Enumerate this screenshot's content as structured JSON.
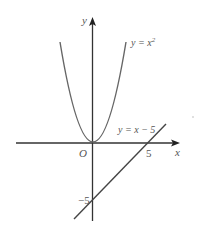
{
  "diagram": {
    "axes": {
      "x_label": "x",
      "y_label": "y",
      "origin_label": "O",
      "x_tick_label": "5",
      "y_tick_label": "−5"
    },
    "curves": [
      {
        "name": "parabola",
        "label_prefix": "y = x",
        "label_sup": "2",
        "equation": "y = x^2",
        "x_range": [
          -3,
          3
        ]
      },
      {
        "name": "line",
        "label": "y = x − 5",
        "equation": "y = x - 5",
        "x_range": [
          -1.7,
          6.6
        ]
      }
    ],
    "colors": {
      "axis": "#333333",
      "curve": "#555555",
      "text": "#555555"
    }
  }
}
